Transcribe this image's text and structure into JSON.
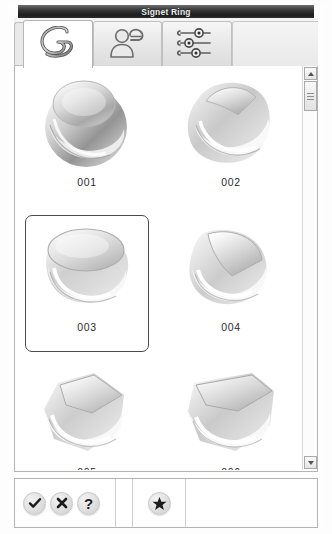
{
  "window": {
    "title": "Signet Ring"
  },
  "tabs": [
    {
      "id": "tab-rings",
      "icon": "ring-icon",
      "label": "Rings",
      "active": true
    },
    {
      "id": "tab-wearer",
      "icon": "person-ring-icon",
      "label": "Wearer",
      "active": false
    },
    {
      "id": "tab-settings",
      "icon": "sliders-icon",
      "label": "Settings",
      "active": false
    }
  ],
  "gallery": {
    "selected_id": "003",
    "items": [
      {
        "id": "001",
        "label": "001",
        "shape": "oval",
        "selected": false
      },
      {
        "id": "002",
        "label": "002",
        "shape": "marquise",
        "selected": false
      },
      {
        "id": "003",
        "label": "003",
        "shape": "round",
        "selected": true
      },
      {
        "id": "004",
        "label": "004",
        "shape": "teardrop",
        "selected": false
      },
      {
        "id": "005",
        "label": "005",
        "shape": "pentagon",
        "selected": false
      },
      {
        "id": "006",
        "label": "006",
        "shape": "cushion",
        "selected": false
      }
    ]
  },
  "scrollbar": {
    "up_icon": "chevron-up-icon",
    "down_icon": "chevron-down-icon",
    "thumb_icon": "grip-icon"
  },
  "toolbar": {
    "buttons": [
      {
        "id": "ok",
        "icon": "check-icon",
        "label": "OK"
      },
      {
        "id": "cancel",
        "icon": "close-icon",
        "label": "Cancel"
      },
      {
        "id": "help",
        "icon": "question-icon",
        "label": "Help"
      }
    ],
    "favorite": {
      "id": "favorite",
      "icon": "star-icon",
      "label": "Favorite"
    }
  },
  "colors": {
    "titlebar_dark": "#1d1d1d",
    "selection_border": "#4a4a4a",
    "panel_border": "#b4b4b4",
    "tab_inactive": "#e6e6e6",
    "tab_active": "#ffffff"
  }
}
